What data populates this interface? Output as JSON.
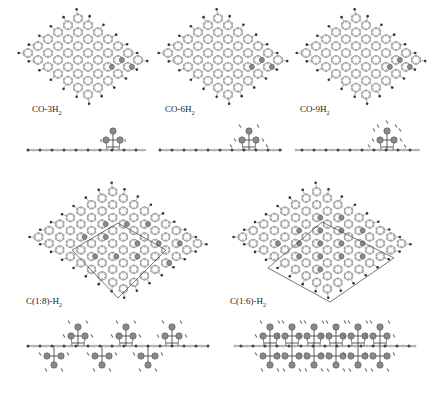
{
  "figure": {
    "background": "#ffffff",
    "colors": {
      "carbon": "#b8b8b8",
      "bond": "#7a7a7a",
      "hydrogen": "#333333",
      "adsorbate": "#8a8a8a",
      "cell": "#555555",
      "text": "#222222"
    },
    "panels": [
      {
        "id": "co-3h2",
        "label_main": "CO-3H",
        "label_sub": "2",
        "top_view": {
          "x": 18,
          "y": 8,
          "w": 130,
          "h": 90,
          "rows": 6,
          "cols": 7,
          "adsorbed": [
            [
              3,
              5
            ],
            [
              4,
              5
            ],
            [
              4,
              6
            ]
          ]
        },
        "side_view": {
          "x": 28,
          "y": 150,
          "w": 118,
          "adsorbate_x": 113,
          "h2_count": 3
        },
        "label_pos": {
          "x": 32,
          "y": 104
        }
      },
      {
        "id": "co-6h2",
        "label_main": "CO-6H",
        "label_sub": "2",
        "top_view": {
          "x": 158,
          "y": 8,
          "w": 130,
          "h": 90,
          "rows": 6,
          "cols": 7,
          "adsorbed": [
            [
              3,
              5
            ],
            [
              4,
              5
            ],
            [
              4,
              6
            ]
          ]
        },
        "side_view": {
          "x": 160,
          "y": 150,
          "w": 122,
          "adsorbate_x": 249,
          "h2_count": 6
        },
        "label_pos": {
          "x": 165,
          "y": 104
        }
      },
      {
        "id": "co-9h2",
        "label_main": "CO-9H",
        "label_sub": "2",
        "top_view": {
          "x": 296,
          "y": 8,
          "w": 130,
          "h": 90,
          "rows": 6,
          "cols": 7,
          "adsorbed": [
            [
              3,
              5
            ],
            [
              4,
              5
            ],
            [
              4,
              6
            ]
          ]
        },
        "side_view": {
          "x": 296,
          "y": 150,
          "w": 124,
          "adsorbate_x": 387,
          "h2_count": 9
        },
        "label_pos": {
          "x": 300,
          "y": 104
        }
      },
      {
        "id": "c18-h2",
        "label_main": "C(1:8)-H",
        "label_sub": "2",
        "top_view": {
          "x": 28,
          "y": 182,
          "w": 180,
          "h": 110,
          "rows": 8,
          "cols": 9,
          "unit_cell": [
            [
              72,
              250
            ],
            [
              118,
              223
            ],
            [
              166,
              250
            ],
            [
              118,
              298
            ]
          ],
          "adsorbed": [
            [
              2,
              2
            ],
            [
              3,
              3
            ],
            [
              2,
              5
            ],
            [
              3,
              6
            ],
            [
              5,
              3
            ],
            [
              5,
              6
            ],
            [
              6,
              4
            ],
            [
              6,
              7
            ],
            [
              1,
              4
            ],
            [
              4,
              2
            ],
            [
              4,
              5
            ],
            [
              4,
              8
            ]
          ]
        },
        "side_view": {
          "x": 28,
          "y": 346,
          "w": 180,
          "adsorbate_xs": [
            78,
            126,
            172
          ],
          "mode": "both"
        },
        "label_pos": {
          "x": 26,
          "y": 296
        }
      },
      {
        "id": "c16-h2",
        "label_main": "C(1:6)-H",
        "label_sub": "2",
        "top_view": {
          "x": 232,
          "y": 182,
          "w": 180,
          "h": 110,
          "rows": 8,
          "cols": 9,
          "unit_cell": [
            [
              268,
              268
            ],
            [
              322,
              222
            ],
            [
              394,
              258
            ],
            [
              330,
              302
            ]
          ],
          "adsorbed": [
            [
              1,
              2
            ],
            [
              1,
              4
            ],
            [
              1,
              6
            ],
            [
              2,
              3
            ],
            [
              2,
              5
            ],
            [
              3,
              2
            ],
            [
              3,
              4
            ],
            [
              3,
              6
            ],
            [
              4,
              3
            ],
            [
              4,
              5
            ],
            [
              4,
              7
            ],
            [
              5,
              2
            ],
            [
              5,
              4
            ],
            [
              5,
              6
            ],
            [
              6,
              3
            ],
            [
              6,
              5
            ]
          ]
        },
        "side_view": {
          "x": 235,
          "y": 346,
          "w": 180,
          "adsorbate_xs": [
            270,
            292,
            314,
            336,
            358,
            380
          ],
          "mode": "dense"
        },
        "label_pos": {
          "x": 230,
          "y": 296
        }
      }
    ]
  }
}
